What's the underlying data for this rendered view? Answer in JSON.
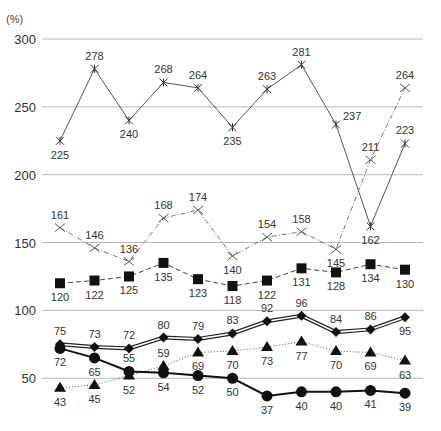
{
  "chart_data": {
    "type": "line",
    "title": "",
    "xlabel": "",
    "ylabel": "(%)",
    "ylim": [
      30,
      300
    ],
    "yticks": [
      50,
      100,
      150,
      200,
      250,
      300
    ],
    "grid": "horizontal",
    "legend": "none",
    "x": [
      1,
      2,
      3,
      4,
      5,
      6,
      7,
      8,
      9,
      10,
      11
    ],
    "series": [
      {
        "name": "series-asterisk-solid",
        "marker": "asterisk",
        "line": "solid-thin",
        "values": [
          225,
          278,
          240,
          268,
          264,
          235,
          263,
          281,
          237,
          162,
          223
        ]
      },
      {
        "name": "series-x-dashdot",
        "marker": "x",
        "line": "dash-dot",
        "values": [
          161,
          146,
          136,
          168,
          174,
          140,
          154,
          158,
          145,
          211,
          264
        ]
      },
      {
        "name": "series-square-dashed",
        "marker": "square",
        "line": "dashed",
        "values": [
          120,
          122,
          125,
          135,
          123,
          118,
          122,
          131,
          128,
          134,
          130
        ]
      },
      {
        "name": "series-diamond-double",
        "marker": "diamond",
        "line": "double",
        "values": [
          75,
          73,
          72,
          80,
          79,
          83,
          92,
          96,
          84,
          86,
          95
        ]
      },
      {
        "name": "series-triangle-dotted",
        "marker": "triangle",
        "line": "dotted",
        "values": [
          43,
          45,
          52,
          59,
          69,
          70,
          73,
          77,
          70,
          69,
          63
        ]
      },
      {
        "name": "series-circle-bold",
        "marker": "circle",
        "line": "solid-bold",
        "values": [
          72,
          65,
          55,
          54,
          52,
          50,
          37,
          40,
          40,
          41,
          39
        ]
      }
    ]
  },
  "labels": {
    "unit": "(%)",
    "yticks": [
      "300",
      "250",
      "200",
      "150",
      "100",
      "50"
    ]
  },
  "label_offsets": {
    "series-asterisk-solid": [
      "below",
      "above",
      "below",
      "above",
      "above",
      "below",
      "above",
      "above",
      "right",
      "below",
      "above"
    ],
    "series-x-dashdot": [
      "above",
      "above",
      "above",
      "above",
      "above",
      "below",
      "above",
      "above",
      "below",
      "above",
      "above"
    ],
    "series-square-dashed": [
      "below",
      "below",
      "below",
      "below",
      "below",
      "below",
      "below",
      "below",
      "below",
      "below",
      "below"
    ],
    "series-diamond-double": [
      "above",
      "above",
      "above",
      "above",
      "above",
      "above",
      "above",
      "above",
      "above",
      "above",
      "below"
    ],
    "series-triangle-dotted": [
      "below",
      "below",
      "below",
      "above",
      "below",
      "below",
      "below",
      "below",
      "below",
      "below",
      "below"
    ],
    "series-circle-bold": [
      "below",
      "below",
      "above",
      "below",
      "below",
      "below",
      "below",
      "below",
      "below",
      "below",
      "below"
    ]
  }
}
